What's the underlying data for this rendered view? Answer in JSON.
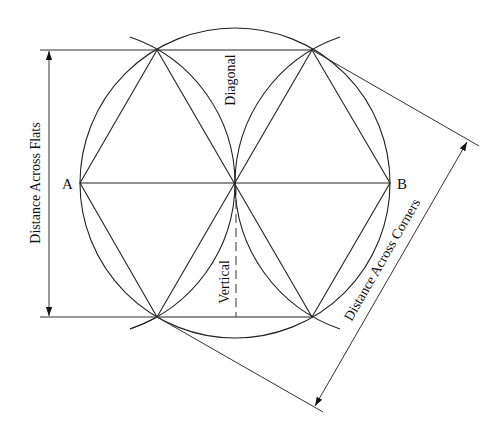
{
  "diagram": {
    "labels": {
      "point_a": "A",
      "point_b": "B",
      "diagonal": "Diagonal",
      "vertical": "Vertical",
      "across_flats": "Distance Across Flats",
      "across_corners": "Distance Across Corners"
    },
    "colors": {
      "line": "#222222",
      "text": "#111111",
      "background": "#ffffff"
    },
    "geometry": {
      "center": [
        235,
        183
      ],
      "radius": 155,
      "vertices": {
        "A": [
          80,
          183
        ],
        "top_left": [
          157,
          50
        ],
        "top_right": [
          312,
          50
        ],
        "B": [
          390,
          183
        ],
        "bottom_right": [
          312,
          317
        ],
        "bottom_left": [
          157,
          317
        ]
      }
    }
  }
}
